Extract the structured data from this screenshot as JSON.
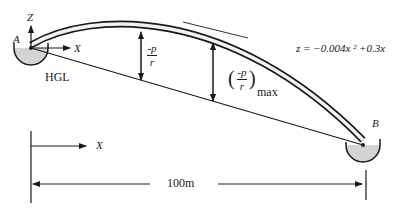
{
  "diagram": {
    "type": "siphon-pipeline",
    "points": {
      "A": {
        "label": "A"
      },
      "B": {
        "label": "B"
      }
    },
    "axes": {
      "z_label": "Z",
      "x_label": "X",
      "x_label_bottom": "X"
    },
    "hgl_label": "HGL",
    "pressure_label": {
      "num": "-p",
      "den": "r"
    },
    "pressure_max_label": {
      "num": "-p",
      "den": "r",
      "sub": "max"
    },
    "equation": "z = −0.004x ² +0.3x",
    "dimension": "100m",
    "colors": {
      "line": "#1a1a1a",
      "reservoir_fill": "#d4d4d4",
      "pipe_inner": "#f2f2f2",
      "background": "#ffffff"
    }
  }
}
